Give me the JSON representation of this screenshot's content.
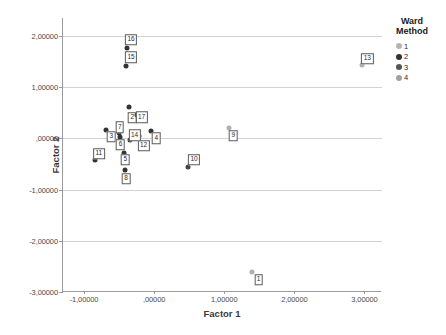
{
  "chart_data": {
    "type": "scatter",
    "title": "",
    "xlabel": "Factor 1",
    "ylabel": "Factor 2",
    "xlim": [
      -1.3,
      3.25
    ],
    "ylim": [
      -3.0,
      2.35
    ],
    "grid": true,
    "legend_position": "right",
    "xticks": [
      "-1,00000",
      ",00000",
      "1,00000",
      "2,00000",
      "3,00000"
    ],
    "xtick_values": [
      -1,
      0,
      1,
      2,
      3
    ],
    "yticks": [
      "2,00000",
      "1,00000",
      ",00000",
      "-1,00000",
      "-2,00000",
      "-3,00000"
    ],
    "ytick_values": [
      2,
      1,
      0,
      -1,
      -2,
      -3
    ],
    "legend": {
      "title_line1": "Ward",
      "title_line2": "Method",
      "entries": [
        {
          "label": "1",
          "color": "#b4b4b4"
        },
        {
          "label": "2",
          "color": "#333333"
        },
        {
          "label": "3",
          "color": "#555555"
        },
        {
          "label": "4",
          "color": "#a0a0a0"
        }
      ]
    },
    "points": [
      {
        "label": "1",
        "x": 1.4,
        "y": -2.6,
        "group": 1,
        "color": "#b0b0b0",
        "lx": 1.49,
        "ly": -2.76
      },
      {
        "label": "2",
        "x": -0.36,
        "y": 0.62,
        "group": 2,
        "color": "#333333",
        "lx": -0.31,
        "ly": 0.4
      },
      {
        "label": "3",
        "x": -0.68,
        "y": 0.17,
        "group": 2,
        "color": "#333333",
        "lx": -0.61,
        "ly": 0.03
      },
      {
        "label": "4",
        "x": -0.04,
        "y": 0.15,
        "group": 2,
        "color": "#333333",
        "lx": 0.03,
        "ly": 0.0
      },
      {
        "label": "5",
        "x": -0.43,
        "y": -0.28,
        "group": 2,
        "color": "#333333",
        "lx": -0.41,
        "ly": -0.42
      },
      {
        "label": "6",
        "x": -0.48,
        "y": 0.03,
        "group": 2,
        "color": "#333333",
        "lx": -0.48,
        "ly": -0.12
      },
      {
        "label": "7",
        "x": -0.5,
        "y": 0.1,
        "group": 2,
        "color": "#333333",
        "lx": -0.49,
        "ly": 0.22
      },
      {
        "label": "8",
        "x": -0.42,
        "y": -0.62,
        "group": 2,
        "color": "#333333",
        "lx": -0.4,
        "ly": -0.79
      },
      {
        "label": "9",
        "x": 1.07,
        "y": 0.2,
        "group": 1,
        "color": "#b0b0b0",
        "lx": 1.13,
        "ly": 0.05
      },
      {
        "label": "10",
        "x": 0.49,
        "y": -0.55,
        "group": 3,
        "color": "#444444",
        "lx": 0.57,
        "ly": -0.42
      },
      {
        "label": "11",
        "x": -0.85,
        "y": -0.43,
        "group": 2,
        "color": "#333333",
        "lx": -0.79,
        "ly": -0.3
      },
      {
        "label": "12",
        "x": -0.21,
        "y": 0.04,
        "group": 2,
        "color": "#333333",
        "lx": -0.15,
        "ly": -0.14
      },
      {
        "label": "13",
        "x": 2.96,
        "y": 1.43,
        "group": 1,
        "color": "#b0b0b0",
        "lx": 3.04,
        "ly": 1.55
      },
      {
        "label": "14",
        "x": -0.34,
        "y": -0.03,
        "group": 2,
        "color": "#333333",
        "lx": -0.28,
        "ly": 0.06
      },
      {
        "label": "15",
        "x": -0.4,
        "y": 1.42,
        "group": 2,
        "color": "#333333",
        "lx": -0.33,
        "ly": 1.58
      },
      {
        "label": "16",
        "x": -0.39,
        "y": 1.77,
        "group": 2,
        "color": "#333333",
        "lx": -0.33,
        "ly": 1.93
      },
      {
        "label": "17",
        "x": -0.25,
        "y": 0.46,
        "group": 2,
        "color": "#333333",
        "lx": -0.18,
        "ly": 0.41
      }
    ]
  }
}
